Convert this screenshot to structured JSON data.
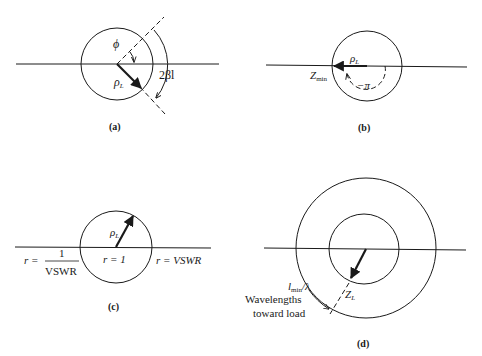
{
  "figure": {
    "panels": [
      {
        "id": "a",
        "caption": "(a)",
        "labels": {
          "angle_phi": "ϕ",
          "reflection": "ρ",
          "reflection_sub": "L",
          "arc": "2βl"
        }
      },
      {
        "id": "b",
        "caption": "(b)",
        "labels": {
          "reflection": "ρ",
          "reflection_sub": "L",
          "zmin": "Z",
          "zmin_sub": "min",
          "angle": "−π"
        }
      },
      {
        "id": "c",
        "caption": "(c)",
        "labels": {
          "reflection": "ρ",
          "reflection_sub": "L",
          "left_r": "r =",
          "left_num": "1",
          "left_den": "VSWR",
          "center_r": "r = 1",
          "right_r": "r = VSWR"
        }
      },
      {
        "id": "d",
        "caption": "(d)",
        "labels": {
          "distance": "l",
          "distance_sub": "min",
          "distance_tail": "/λ",
          "load": "Z",
          "load_sub": "L",
          "direction_line1": "Wavelengths",
          "direction_line2": "toward load"
        }
      }
    ]
  },
  "colors": {
    "ink": "#1a1a1a",
    "background": "#ffffff"
  }
}
